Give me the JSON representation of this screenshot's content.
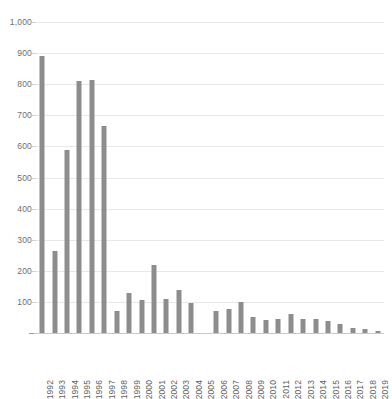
{
  "chart_data": {
    "type": "bar",
    "title": "",
    "subtitle": "",
    "xlabel": "",
    "ylabel": "",
    "ylim": [
      0,
      1000
    ],
    "y_ticks": [
      0,
      100,
      200,
      300,
      400,
      500,
      600,
      700,
      800,
      900,
      1000
    ],
    "y_tick_labels": [
      "0",
      "100",
      "200",
      "300",
      "400",
      "500",
      "600",
      "700",
      "800",
      "900",
      "1,000"
    ],
    "grid": "horizontal",
    "legend": "none",
    "bar_color": "#8d8d8d",
    "gridline_color": "#e8e8e8",
    "axis_color": "#c9c9c9",
    "categories": [
      "1992",
      "1993",
      "1994",
      "1995",
      "1996",
      "1997",
      "1998",
      "1999",
      "2000",
      "2001",
      "2002",
      "2003",
      "2004",
      "2005",
      "2006",
      "2007",
      "2008",
      "2009",
      "2010",
      "2011",
      "2012",
      "2013",
      "2014",
      "2015",
      "2016",
      "2017",
      "2018",
      "2019"
    ],
    "values": [
      890,
      265,
      590,
      810,
      812,
      665,
      70,
      130,
      105,
      218,
      110,
      138,
      95,
      0,
      72,
      78,
      100,
      50,
      42,
      44,
      60,
      45,
      45,
      38,
      30,
      15,
      12,
      6
    ],
    "series": [
      {
        "name": "count",
        "values": [
          890,
          265,
          590,
          810,
          812,
          665,
          70,
          130,
          105,
          218,
          110,
          138,
          95,
          0,
          72,
          78,
          100,
          50,
          42,
          44,
          60,
          45,
          45,
          38,
          30,
          15,
          12,
          6
        ]
      }
    ]
  },
  "caption": ""
}
